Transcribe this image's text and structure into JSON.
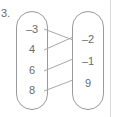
{
  "figure": {
    "problem_number": "3.",
    "type": "mapping-diagram",
    "stroke_color": "#9a9a9a",
    "text_color": "#6b6b6b",
    "background_color": "#ffffff"
  },
  "domain_set": {
    "name": "left-oval",
    "elements": [
      {
        "label": "–3",
        "x": 32,
        "y": 30
      },
      {
        "label": "4",
        "x": 32,
        "y": 50
      },
      {
        "label": "6",
        "x": 32,
        "y": 70
      },
      {
        "label": "8",
        "x": 32,
        "y": 90
      }
    ],
    "oval": {
      "x": 16,
      "y": 11,
      "width": 32,
      "height": 99,
      "rx": 16
    }
  },
  "range_set": {
    "name": "right-oval",
    "elements": [
      {
        "label": "–2",
        "x": 88,
        "y": 40
      },
      {
        "label": "–1",
        "x": 88,
        "y": 62
      },
      {
        "label": "9",
        "x": 88,
        "y": 84
      }
    ],
    "oval": {
      "x": 72,
      "y": 11,
      "width": 32,
      "height": 99,
      "rx": 16
    }
  },
  "mappings": [
    {
      "from": "–3",
      "to": "–2",
      "x1": 44,
      "y1": 29,
      "x2": 73,
      "y2": 40
    },
    {
      "from": "4",
      "to": "–2",
      "x1": 44,
      "y1": 50,
      "x2": 73,
      "y2": 37
    },
    {
      "from": "6",
      "to": "–1",
      "x1": 44,
      "y1": 71,
      "x2": 73,
      "y2": 59
    },
    {
      "from": "8",
      "to": "9",
      "x1": 44,
      "y1": 91,
      "x2": 73,
      "y2": 80
    }
  ],
  "edge_rule": {
    "x": 110,
    "y1": 0,
    "y2": 117
  }
}
